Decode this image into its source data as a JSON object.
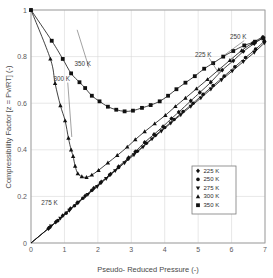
{
  "chart_data": {
    "type": "scatter",
    "title": "",
    "xlabel": "Pseudo- Reduced Pressure (-)",
    "ylabel": "Compressibility Factor [z = Pv/RT] (-)",
    "xlim": [
      0,
      7
    ],
    "ylim": [
      0,
      1
    ],
    "xticks": [
      "0",
      "1",
      "2",
      "3",
      "4",
      "5",
      "6",
      "7"
    ],
    "yticks": [
      "0",
      "0.2",
      "0.4",
      "0.6",
      "0.8",
      "1"
    ],
    "grid": true,
    "legend_position": "inside-lower-right",
    "series": [
      {
        "name": "225 K",
        "marker": "diamond",
        "color": "#111111",
        "points": [
          [
            0.0,
            0.0
          ],
          [
            0.52,
            0.062
          ],
          [
            0.74,
            0.09
          ],
          [
            0.95,
            0.118
          ],
          [
            1.18,
            0.148
          ],
          [
            1.38,
            0.172
          ],
          [
            1.62,
            0.202
          ],
          [
            1.88,
            0.236
          ],
          [
            2.1,
            0.262
          ],
          [
            2.38,
            0.296
          ],
          [
            2.62,
            0.328
          ],
          [
            2.92,
            0.366
          ],
          [
            3.12,
            0.392
          ],
          [
            3.4,
            0.432
          ],
          [
            3.68,
            0.466
          ],
          [
            3.95,
            0.5
          ],
          [
            4.2,
            0.534
          ],
          [
            4.42,
            0.562
          ],
          [
            4.78,
            0.61
          ],
          [
            5.05,
            0.646
          ],
          [
            5.38,
            0.69
          ],
          [
            5.72,
            0.742
          ],
          [
            6.05,
            0.782
          ],
          [
            6.35,
            0.822
          ],
          [
            6.68,
            0.856
          ],
          [
            6.95,
            0.882
          ]
        ]
      },
      {
        "name": "250 K",
        "marker": "circle",
        "color": "#111111",
        "points": [
          [
            0.0,
            0.0
          ],
          [
            0.55,
            0.066
          ],
          [
            0.8,
            0.096
          ],
          [
            1.05,
            0.128
          ],
          [
            1.3,
            0.16
          ],
          [
            1.55,
            0.192
          ],
          [
            1.82,
            0.226
          ],
          [
            2.08,
            0.258
          ],
          [
            2.35,
            0.292
          ],
          [
            2.62,
            0.324
          ],
          [
            2.9,
            0.36
          ],
          [
            3.18,
            0.394
          ],
          [
            3.45,
            0.428
          ],
          [
            3.72,
            0.462
          ],
          [
            4.0,
            0.496
          ],
          [
            4.28,
            0.53
          ],
          [
            4.55,
            0.564
          ],
          [
            4.85,
            0.6
          ],
          [
            5.15,
            0.638
          ],
          [
            5.45,
            0.676
          ],
          [
            5.78,
            0.716
          ],
          [
            6.1,
            0.756
          ],
          [
            6.42,
            0.796
          ],
          [
            6.72,
            0.832
          ],
          [
            6.98,
            0.866
          ]
        ]
      },
      {
        "name": "275 K",
        "marker": "triangle-down",
        "color": "#111111",
        "points": [
          [
            0.0,
            0.0
          ],
          [
            0.6,
            0.072
          ],
          [
            0.88,
            0.106
          ],
          [
            1.15,
            0.14
          ],
          [
            1.42,
            0.174
          ],
          [
            1.7,
            0.208
          ],
          [
            1.98,
            0.242
          ],
          [
            2.25,
            0.276
          ],
          [
            2.52,
            0.31
          ],
          [
            2.8,
            0.344
          ],
          [
            3.08,
            0.378
          ],
          [
            3.35,
            0.412
          ],
          [
            3.62,
            0.446
          ],
          [
            3.9,
            0.48
          ],
          [
            4.18,
            0.514
          ],
          [
            4.48,
            0.55
          ],
          [
            4.78,
            0.586
          ],
          [
            5.08,
            0.622
          ],
          [
            5.38,
            0.66
          ],
          [
            5.7,
            0.7
          ],
          [
            6.02,
            0.738
          ],
          [
            6.35,
            0.778
          ],
          [
            6.68,
            0.818
          ],
          [
            6.98,
            0.858
          ]
        ]
      },
      {
        "name": "300 K",
        "marker": "triangle-up",
        "color": "#111111",
        "points": [
          [
            0.0,
            1.0
          ],
          [
            0.58,
            0.79
          ],
          [
            0.72,
            0.685
          ],
          [
            0.88,
            0.59
          ],
          [
            1.02,
            0.525
          ],
          [
            1.12,
            0.45
          ],
          [
            1.2,
            0.4
          ],
          [
            1.26,
            0.372
          ],
          [
            1.32,
            0.33
          ],
          [
            1.4,
            0.298
          ],
          [
            1.52,
            0.285
          ],
          [
            1.66,
            0.282
          ],
          [
            1.82,
            0.292
          ],
          [
            2.02,
            0.312
          ],
          [
            2.3,
            0.344
          ],
          [
            2.58,
            0.376
          ],
          [
            2.88,
            0.412
          ],
          [
            3.12,
            0.444
          ],
          [
            3.4,
            0.478
          ],
          [
            3.7,
            0.512
          ],
          [
            4.02,
            0.548
          ],
          [
            4.32,
            0.586
          ],
          [
            4.62,
            0.622
          ],
          [
            4.95,
            0.662
          ],
          [
            5.28,
            0.702
          ],
          [
            5.62,
            0.744
          ],
          [
            5.95,
            0.784
          ],
          [
            6.3,
            0.826
          ],
          [
            6.62,
            0.858
          ],
          [
            6.92,
            0.884
          ]
        ]
      },
      {
        "name": "350 K",
        "marker": "square",
        "color": "#111111",
        "points": [
          [
            0.0,
            1.0
          ],
          [
            0.62,
            0.868
          ],
          [
            0.95,
            0.79
          ],
          [
            1.2,
            0.728
          ],
          [
            1.45,
            0.69
          ],
          [
            1.62,
            0.665
          ],
          [
            1.82,
            0.632
          ],
          [
            2.05,
            0.608
          ],
          [
            2.3,
            0.585
          ],
          [
            2.55,
            0.572
          ],
          [
            2.8,
            0.565
          ],
          [
            3.05,
            0.568
          ],
          [
            3.32,
            0.58
          ],
          [
            3.58,
            0.592
          ],
          [
            3.85,
            0.608
          ],
          [
            4.1,
            0.632
          ],
          [
            4.35,
            0.66
          ],
          [
            4.62,
            0.688
          ],
          [
            4.9,
            0.716
          ],
          [
            5.18,
            0.748
          ],
          [
            5.45,
            0.772
          ],
          [
            5.75,
            0.8
          ],
          [
            6.05,
            0.824
          ],
          [
            6.38,
            0.848
          ],
          [
            6.7,
            0.864
          ],
          [
            6.95,
            0.878
          ]
        ]
      }
    ],
    "annotations": [
      {
        "text": "300 K",
        "x": 0.92,
        "y": 0.695,
        "leader_to_x": 1.22,
        "leader_to_y": 0.455
      },
      {
        "text": "350 K",
        "x": 1.55,
        "y": 0.76,
        "leader_to_x": 1.38,
        "leader_to_y": 0.915
      },
      {
        "text": "275 K",
        "x": 0.55,
        "y": 0.165,
        "leader_to_x": null,
        "leader_to_y": null
      },
      {
        "text": "225 K",
        "x": 5.15,
        "y": 0.8,
        "leader_to_x": 5.62,
        "leader_to_y": 0.728
      },
      {
        "text": "250 K",
        "x": 6.2,
        "y": 0.875,
        "leader_to_x": 5.8,
        "leader_to_y": 0.808
      }
    ],
    "legend_entries": [
      {
        "label": "225 K",
        "marker": "diamond"
      },
      {
        "label": "250 K",
        "marker": "circle"
      },
      {
        "label": "275 K",
        "marker": "triangle-down"
      },
      {
        "label": "300 K",
        "marker": "triangle-up"
      },
      {
        "label": "350 K",
        "marker": "square"
      }
    ],
    "colors": {
      "ink": "#111111",
      "grid": "#d6d6d6",
      "frame": "#9a9a9a",
      "text": "#4a4a4a",
      "background": "#ffffff"
    }
  }
}
